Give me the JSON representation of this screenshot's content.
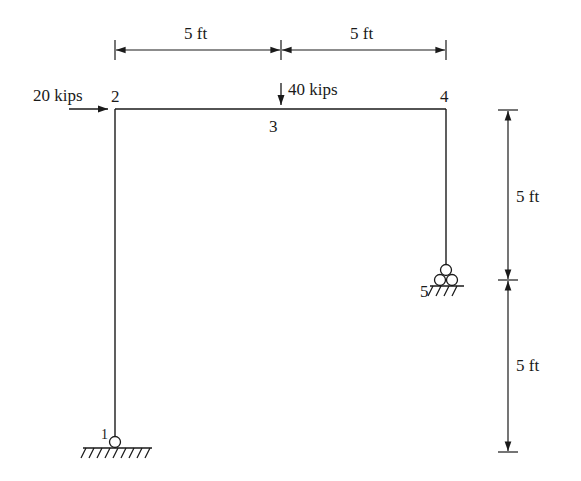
{
  "diagram": {
    "type": "plane frame structural analysis diagram",
    "stroke_color": "#1a1a1a",
    "background_color": "#ffffff"
  },
  "nodes": [
    {
      "id": "1",
      "label": "1",
      "support": "pin"
    },
    {
      "id": "2",
      "label": "2",
      "support": "none"
    },
    {
      "id": "3",
      "label": "3",
      "support": "none"
    },
    {
      "id": "4",
      "label": "4",
      "support": "none"
    },
    {
      "id": "5",
      "label": "5",
      "support": "roller"
    }
  ],
  "members": [
    {
      "from": "1",
      "to": "2"
    },
    {
      "from": "2",
      "to": "3"
    },
    {
      "from": "3",
      "to": "4"
    },
    {
      "from": "4",
      "to": "5"
    }
  ],
  "loads": [
    {
      "node": "2",
      "label": "20 kips",
      "direction": "right"
    },
    {
      "node": "3",
      "label": "40 kips",
      "direction": "down"
    }
  ],
  "dimensions": {
    "top": [
      {
        "label": "5 ft",
        "span": "2-3"
      },
      {
        "label": "5 ft",
        "span": "3-4"
      }
    ],
    "right": [
      {
        "label": "5 ft",
        "span": "4-5"
      },
      {
        "label": "5 ft",
        "span": "5-ground"
      }
    ]
  }
}
